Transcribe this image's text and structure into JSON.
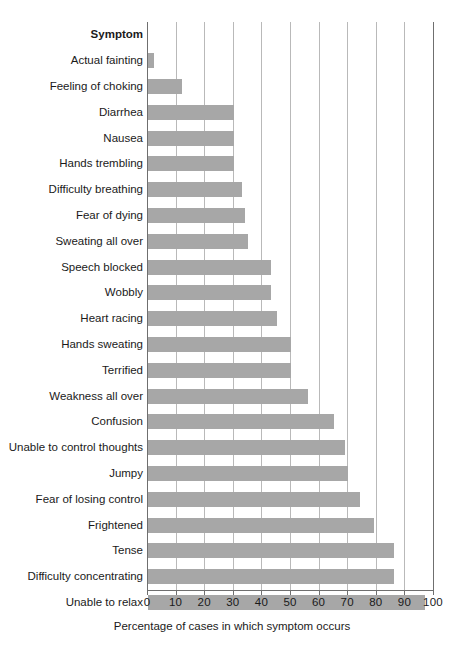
{
  "chart_data": {
    "type": "bar",
    "orientation": "horizontal",
    "title": "",
    "subtitle": "",
    "xlabel": "Percentage of cases in which symptom occurs",
    "ylabel": "Symptom",
    "xlim": [
      0,
      100
    ],
    "xticks": [
      0,
      10,
      20,
      30,
      40,
      50,
      60,
      70,
      80,
      90,
      100
    ],
    "xtick_labels": [
      "0",
      "10",
      "20",
      "30",
      "40",
      "50",
      "60",
      "70",
      "80",
      "90",
      "100"
    ],
    "grid": "vertical gridlines at every x tick",
    "legend": "none",
    "bar_color": "#a7a7a7",
    "categories": [
      "Actual fainting",
      "Feeling of choking",
      "Diarrhea",
      "Nausea",
      "Hands trembling",
      "Difficulty breathing",
      "Fear of dying",
      "Sweating all over",
      "Speech blocked",
      "Wobbly",
      "Heart racing",
      "Hands sweating",
      "Terrified",
      "Weakness all over",
      "Confusion",
      "Unable to control thoughts",
      "Jumpy",
      "Fear of losing control",
      "Frightened",
      "Tense",
      "Difficulty concentrating",
      "Unable to relax"
    ],
    "values": [
      2,
      12,
      30,
      30,
      30,
      33,
      34,
      35,
      43,
      43,
      45,
      50,
      50,
      56,
      65,
      69,
      70,
      74,
      79,
      86,
      86,
      97
    ]
  },
  "axis": {
    "y_header": "Symptom",
    "x_title": "Percentage of cases in which symptom occurs"
  },
  "page": {
    "corner_mark": ""
  }
}
